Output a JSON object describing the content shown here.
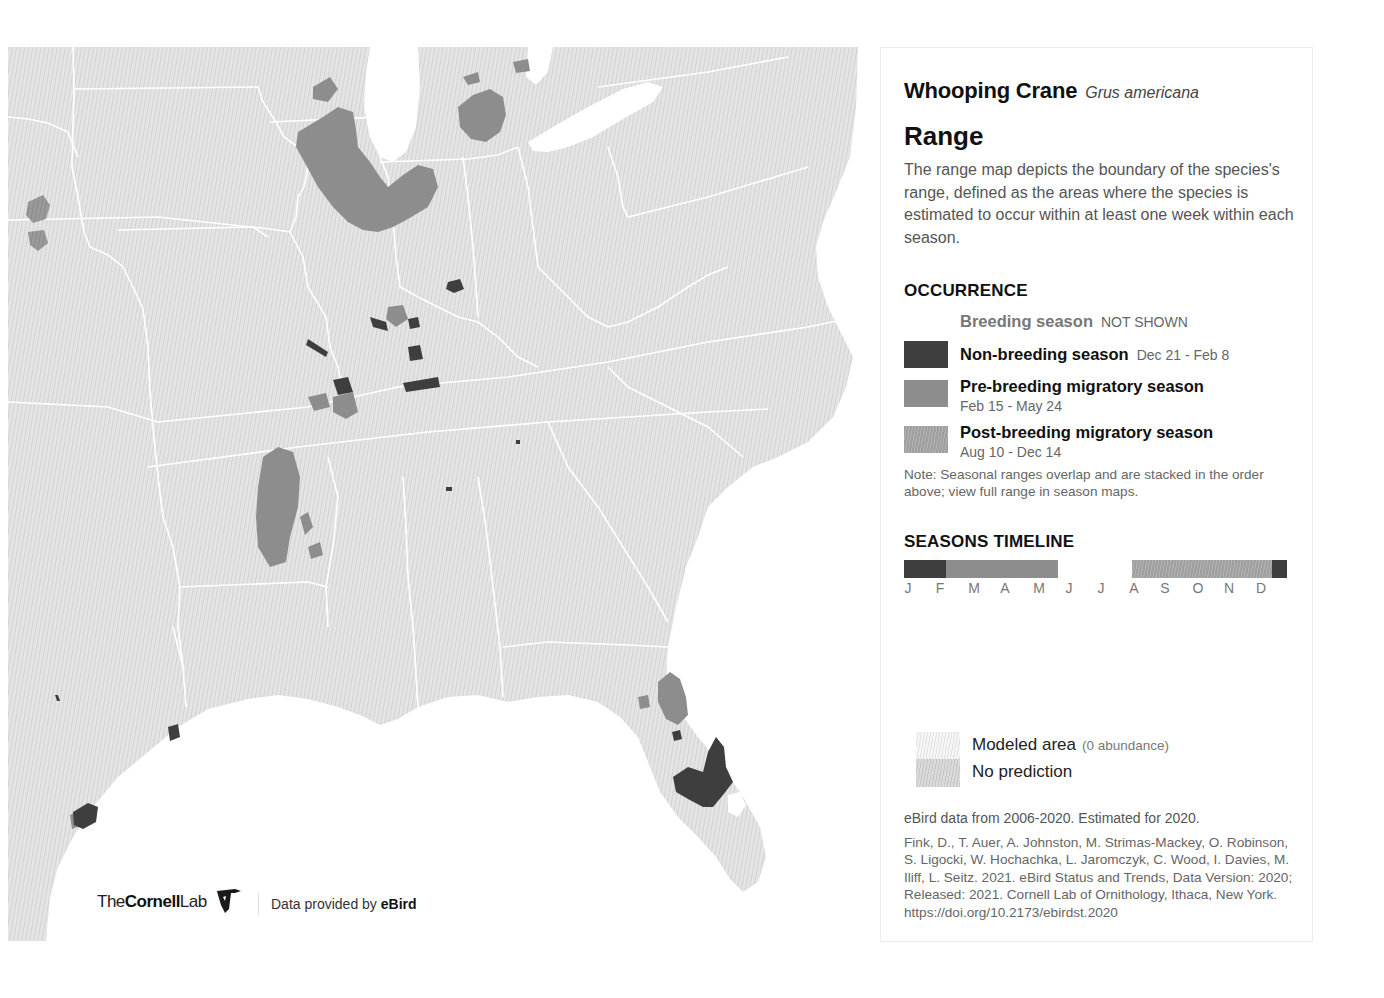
{
  "species": {
    "common_name": "Whooping Crane",
    "scientific_name": "Grus americana"
  },
  "range": {
    "title": "Range",
    "description": "The range map depicts the boundary of the species's range, defined as the areas where the species is estimated to occur within at least one week within each season."
  },
  "occurrence": {
    "heading": "OCCURRENCE",
    "items": [
      {
        "label": "Breeding season",
        "dates": "NOT SHOWN",
        "color": null
      },
      {
        "label": "Non-breeding season",
        "dates": "Dec 21 - Feb 8",
        "color": "#3e3e3e"
      },
      {
        "label": "Pre-breeding migratory season",
        "dates": "Feb 15 - May 24",
        "color": "#8d8d8d"
      },
      {
        "label": "Post-breeding migratory season",
        "dates": "Aug 10 - Dec 14",
        "color": "#a8a8a8"
      }
    ],
    "note": "Note: Seasonal ranges overlap and are stacked in the order above; view full range in season maps."
  },
  "timeline": {
    "heading": "SEASONS TIMELINE",
    "months": [
      "J",
      "F",
      "M",
      "A",
      "M",
      "J",
      "J",
      "A",
      "S",
      "O",
      "N",
      "D"
    ],
    "segments": [
      {
        "season": "Non-breeding season",
        "start_month": 0.0,
        "end_month": 1.27,
        "color": "#3e3e3e"
      },
      {
        "season": "Pre-breeding migratory season",
        "start_month": 1.27,
        "end_month": 4.77,
        "color": "#8d8d8d"
      },
      {
        "season": "Post-breeding migratory season",
        "start_month": 7.1,
        "end_month": 11.5,
        "color": "#a8a8a8"
      },
      {
        "season": "Non-breeding season",
        "start_month": 11.5,
        "end_month": 12.0,
        "color": "#3e3e3e"
      }
    ]
  },
  "legend": {
    "modeled_area": "Modeled area",
    "modeled_area_note": "(0 abundance)",
    "no_prediction": "No prediction"
  },
  "credits": {
    "ebird_note": "eBird data from 2006-2020. Estimated for 2020.",
    "citation": "Fink, D., T. Auer, A. Johnston, M. Strimas-Mackey, O. Robinson, S. Ligocki, W. Hochachka, L. Jaromczyk, C. Wood, I. Davies, M. Iliff, L. Seitz. 2021. eBird Status and Trends, Data Version: 2020; Released: 2021. Cornell Lab of Ornithology, Ithaca, New York. https://doi.org/10.2173/ebirdst.2020"
  },
  "branding": {
    "logo_the": "The",
    "logo_cornell": "Cornell",
    "logo_lab": "Lab",
    "provided_prefix": "Data provided by ",
    "provided_brand": "eBird"
  },
  "colors": {
    "non_breeding": "#3e3e3e",
    "pre_breeding": "#8d8d8d",
    "post_breeding": "#a8a8a8",
    "land": "#e2e2e2",
    "water": "#ffffff",
    "borders": "#ffffff"
  }
}
